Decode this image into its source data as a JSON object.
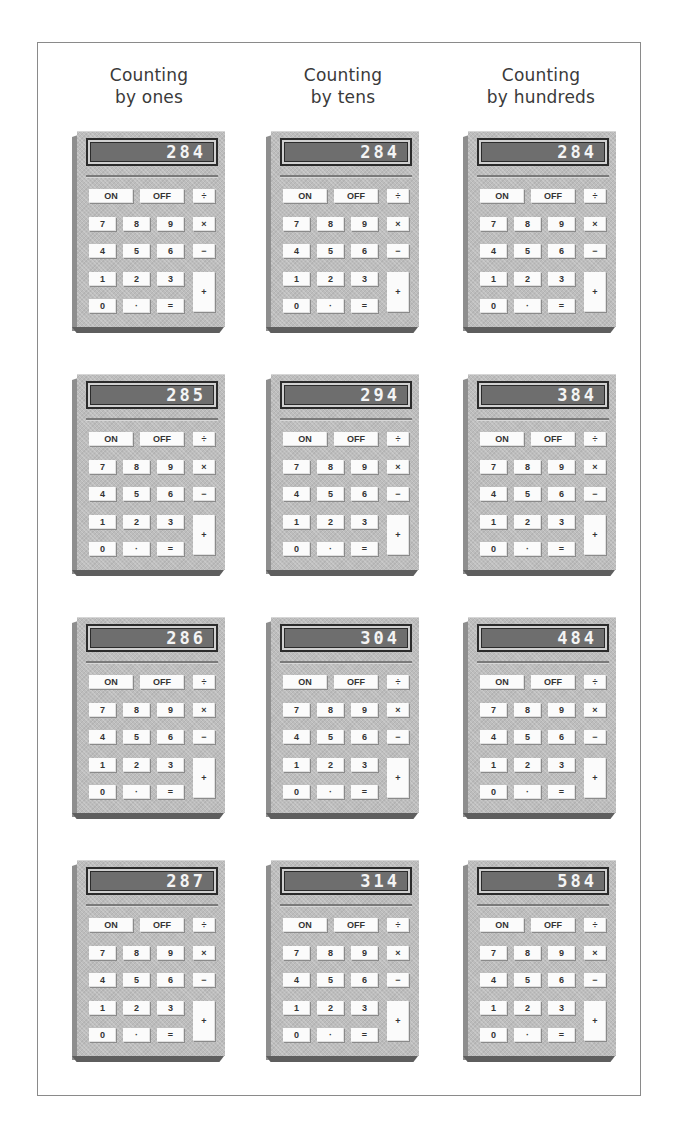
{
  "headers": [
    {
      "line1": "Counting",
      "line2": "by ones"
    },
    {
      "line1": "Counting",
      "line2": "by tens"
    },
    {
      "line1": "Counting",
      "line2": "by hundreds"
    }
  ],
  "keys": {
    "on": "ON",
    "off": "OFF",
    "divide": "÷",
    "multiply": "×",
    "minus": "−",
    "plus": "+",
    "k7": "7",
    "k8": "8",
    "k9": "9",
    "k4": "4",
    "k5": "5",
    "k6": "6",
    "k1": "1",
    "k2": "2",
    "k3": "3",
    "k0": "0",
    "dot": "·",
    "equals": "="
  },
  "calculators": [
    [
      "284",
      "284",
      "284"
    ],
    [
      "285",
      "294",
      "384"
    ],
    [
      "286",
      "304",
      "484"
    ],
    [
      "287",
      "314",
      "584"
    ]
  ],
  "colors": {
    "body": "#bdbdbd",
    "display": "#6e6e6e",
    "digits": "#f4f4f4",
    "key": "#fbfbfb",
    "frame": "#8a8a8a"
  }
}
